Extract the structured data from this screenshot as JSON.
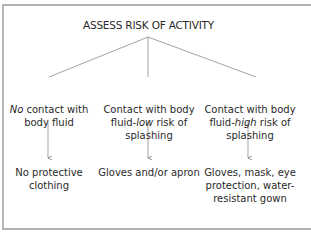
{
  "diagram": {
    "title": "ASSESS RISK OF ACTIVITY",
    "branches": [
      {
        "condition_prefix_italic": "No",
        "condition_rest": " contact with body fluid",
        "outcome": "No protective clothing"
      },
      {
        "condition_before": "Contact with body fluid-",
        "condition_italic": "low",
        "condition_after": " risk of splashing",
        "outcome": "Gloves and/or apron"
      },
      {
        "condition_before": "Contact with body fluid-",
        "condition_italic": "high",
        "condition_after": " risk of splashing",
        "outcome": "Gloves, mask, eye protection, water-resistant gown"
      }
    ],
    "colors": {
      "line": "#8a8a8a",
      "frame": "#b0b0b0",
      "text": "#2a2a2a"
    }
  }
}
